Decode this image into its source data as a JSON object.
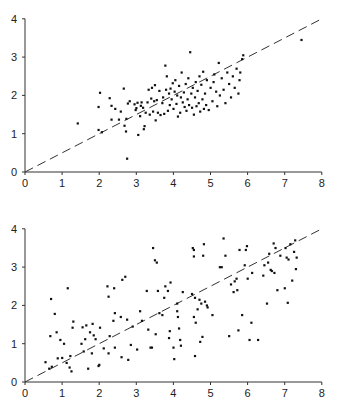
{
  "chart_data": [
    {
      "type": "scatter",
      "title": "",
      "xlabel": "",
      "ylabel": "",
      "xlim": [
        0,
        8
      ],
      "ylim": [
        0,
        4
      ],
      "xticks": [
        0,
        1,
        2,
        3,
        4,
        5,
        6,
        7,
        8
      ],
      "yticks": [
        0,
        1,
        2,
        3,
        4
      ],
      "grid": false,
      "legend": null,
      "reference_line": {
        "style": "dashed",
        "from": [
          0,
          0
        ],
        "to": [
          8,
          4
        ],
        "equation": "y = x/2"
      },
      "points": [
        [
          1.42,
          1.27
        ],
        [
          1.98,
          1.7
        ],
        [
          2.02,
          2.07
        ],
        [
          1.98,
          1.1
        ],
        [
          2.07,
          1.04
        ],
        [
          2.28,
          1.93
        ],
        [
          2.33,
          1.37
        ],
        [
          2.33,
          1.73
        ],
        [
          2.43,
          1.65
        ],
        [
          2.53,
          1.37
        ],
        [
          2.58,
          1.58
        ],
        [
          2.66,
          2.18
        ],
        [
          2.68,
          1.21
        ],
        [
          2.72,
          1.06
        ],
        [
          2.73,
          1.39
        ],
        [
          2.75,
          0.35
        ],
        [
          2.77,
          1.79
        ],
        [
          2.82,
          1.85
        ],
        [
          2.95,
          1.77
        ],
        [
          2.98,
          1.62
        ],
        [
          3.0,
          1.67
        ],
        [
          3.03,
          1.81
        ],
        [
          3.05,
          0.97
        ],
        [
          3.1,
          1.46
        ],
        [
          3.12,
          1.73
        ],
        [
          3.14,
          1.82
        ],
        [
          3.18,
          1.68
        ],
        [
          3.2,
          1.12
        ],
        [
          3.22,
          1.2
        ],
        [
          3.25,
          1.55
        ],
        [
          3.3,
          1.82
        ],
        [
          3.33,
          2.15
        ],
        [
          3.36,
          1.5
        ],
        [
          3.4,
          1.92
        ],
        [
          3.42,
          2.2
        ],
        [
          3.45,
          1.58
        ],
        [
          3.48,
          1.85
        ],
        [
          3.5,
          2.27
        ],
        [
          3.52,
          1.35
        ],
        [
          3.55,
          1.88
        ],
        [
          3.58,
          1.55
        ],
        [
          3.62,
          2.12
        ],
        [
          3.65,
          1.49
        ],
        [
          3.7,
          1.8
        ],
        [
          3.72,
          1.95
        ],
        [
          3.75,
          1.52
        ],
        [
          3.78,
          2.78
        ],
        [
          3.8,
          2.15
        ],
        [
          3.82,
          2.5
        ],
        [
          3.85,
          1.6
        ],
        [
          3.88,
          2.05
        ],
        [
          3.9,
          1.75
        ],
        [
          3.92,
          2.18
        ],
        [
          3.95,
          1.9
        ],
        [
          3.98,
          2.32
        ],
        [
          4.0,
          1.65
        ],
        [
          4.03,
          2.1
        ],
        [
          4.05,
          2.4
        ],
        [
          4.08,
          1.78
        ],
        [
          4.1,
          2.0
        ],
        [
          4.12,
          1.45
        ],
        [
          4.15,
          2.25
        ],
        [
          4.18,
          1.55
        ],
        [
          4.2,
          1.95
        ],
        [
          4.22,
          2.6
        ],
        [
          4.25,
          1.82
        ],
        [
          4.28,
          2.08
        ],
        [
          4.3,
          1.7
        ],
        [
          4.33,
          2.3
        ],
        [
          4.35,
          1.6
        ],
        [
          4.38,
          1.9
        ],
        [
          4.4,
          2.45
        ],
        [
          4.42,
          1.75
        ],
        [
          4.45,
          3.13
        ],
        [
          4.48,
          2.05
        ],
        [
          4.5,
          1.68
        ],
        [
          4.52,
          2.2
        ],
        [
          4.55,
          1.5
        ],
        [
          4.58,
          1.95
        ],
        [
          4.6,
          2.35
        ],
        [
          4.62,
          1.72
        ],
        [
          4.65,
          2.12
        ],
        [
          4.68,
          1.8
        ],
        [
          4.7,
          2.5
        ],
        [
          4.72,
          1.58
        ],
        [
          4.75,
          2.28
        ],
        [
          4.78,
          1.9
        ],
        [
          4.8,
          2.62
        ],
        [
          4.82,
          1.65
        ],
        [
          4.85,
          2.05
        ],
        [
          4.88,
          1.75
        ],
        [
          4.9,
          2.4
        ],
        [
          4.95,
          1.62
        ],
        [
          5.0,
          2.2
        ],
        [
          5.05,
          1.85
        ],
        [
          5.08,
          2.35
        ],
        [
          5.1,
          2.55
        ],
        [
          5.15,
          2.1
        ],
        [
          5.18,
          1.72
        ],
        [
          5.22,
          2.85
        ],
        [
          5.25,
          2.0
        ],
        [
          5.3,
          2.45
        ],
        [
          5.35,
          2.15
        ],
        [
          5.4,
          1.8
        ],
        [
          5.45,
          2.6
        ],
        [
          5.5,
          2.3
        ],
        [
          5.55,
          1.95
        ],
        [
          5.6,
          2.5
        ],
        [
          5.65,
          2.2
        ],
        [
          5.7,
          2.7
        ],
        [
          5.75,
          2.05
        ],
        [
          5.78,
          2.4
        ],
        [
          5.8,
          2.6
        ],
        [
          5.85,
          2.95
        ],
        [
          5.88,
          3.05
        ],
        [
          7.45,
          3.45
        ]
      ]
    },
    {
      "type": "scatter",
      "title": "",
      "xlabel": "",
      "ylabel": "",
      "xlim": [
        0,
        8
      ],
      "ylim": [
        0,
        4
      ],
      "xticks": [
        0,
        1,
        2,
        3,
        4,
        5,
        6,
        7,
        8
      ],
      "yticks": [
        0,
        1,
        2,
        3,
        4
      ],
      "grid": false,
      "legend": null,
      "reference_line": {
        "style": "dashed",
        "from": [
          0,
          0
        ],
        "to": [
          8,
          4
        ],
        "equation": "y = x/2"
      },
      "points": [
        [
          0.55,
          0.52
        ],
        [
          0.65,
          0.35
        ],
        [
          0.68,
          1.2
        ],
        [
          0.7,
          2.17
        ],
        [
          0.72,
          0.4
        ],
        [
          0.8,
          1.78
        ],
        [
          0.85,
          1.3
        ],
        [
          0.88,
          0.62
        ],
        [
          0.95,
          1.1
        ],
        [
          1.0,
          0.63
        ],
        [
          1.05,
          1.0
        ],
        [
          1.12,
          0.5
        ],
        [
          1.15,
          2.45
        ],
        [
          1.2,
          0.38
        ],
        [
          1.22,
          0.68
        ],
        [
          1.25,
          0.28
        ],
        [
          1.28,
          1.42
        ],
        [
          1.3,
          1.58
        ],
        [
          1.52,
          1.0
        ],
        [
          1.55,
          1.43
        ],
        [
          1.58,
          0.8
        ],
        [
          1.62,
          1.12
        ],
        [
          1.65,
          1.48
        ],
        [
          1.7,
          0.35
        ],
        [
          1.75,
          1.3
        ],
        [
          1.8,
          0.75
        ],
        [
          1.82,
          1.52
        ],
        [
          1.85,
          1.22
        ],
        [
          1.9,
          1.12
        ],
        [
          1.98,
          0.42
        ],
        [
          2.0,
          0.45
        ],
        [
          2.02,
          1.42
        ],
        [
          2.12,
          0.88
        ],
        [
          2.22,
          2.5
        ],
        [
          2.25,
          0.75
        ],
        [
          2.25,
          2.23
        ],
        [
          2.28,
          1.2
        ],
        [
          2.38,
          1.6
        ],
        [
          2.4,
          2.45
        ],
        [
          2.42,
          0.9
        ],
        [
          2.42,
          1.8
        ],
        [
          2.58,
          1.7
        ],
        [
          2.6,
          0.65
        ],
        [
          2.62,
          2.67
        ],
        [
          2.7,
          2.75
        ],
        [
          2.75,
          1.63
        ],
        [
          2.78,
          0.58
        ],
        [
          2.85,
          0.97
        ],
        [
          2.9,
          1.45
        ],
        [
          3.02,
          0.85
        ],
        [
          3.1,
          1.85
        ],
        [
          3.15,
          1.6
        ],
        [
          3.28,
          2.38
        ],
        [
          3.32,
          1.37
        ],
        [
          3.38,
          0.9
        ],
        [
          3.42,
          0.9
        ],
        [
          3.45,
          3.5
        ],
        [
          3.5,
          3.18
        ],
        [
          3.52,
          1.25
        ],
        [
          3.55,
          3.12
        ],
        [
          3.58,
          2.38
        ],
        [
          3.62,
          1.8
        ],
        [
          3.7,
          1.75
        ],
        [
          3.75,
          2.2
        ],
        [
          3.78,
          2.5
        ],
        [
          3.85,
          2.38
        ],
        [
          3.88,
          1.15
        ],
        [
          3.9,
          1.33
        ],
        [
          3.92,
          2.6
        ],
        [
          4.0,
          0.9
        ],
        [
          4.02,
          0.6
        ],
        [
          4.1,
          1.85
        ],
        [
          4.1,
          2.05
        ],
        [
          4.12,
          1.7
        ],
        [
          4.15,
          1.4
        ],
        [
          4.18,
          1.1
        ],
        [
          4.2,
          0.95
        ],
        [
          4.25,
          2.35
        ],
        [
          4.5,
          2.3
        ],
        [
          4.52,
          3.5
        ],
        [
          4.55,
          3.45
        ],
        [
          4.55,
          3.28
        ],
        [
          4.55,
          1.7
        ],
        [
          4.58,
          2.2
        ],
        [
          4.58,
          0.68
        ],
        [
          4.6,
          1.55
        ],
        [
          4.65,
          1.9
        ],
        [
          4.7,
          2.15
        ],
        [
          4.72,
          1.05
        ],
        [
          4.75,
          2.05
        ],
        [
          4.78,
          1.18
        ],
        [
          4.8,
          3.3
        ],
        [
          4.82,
          3.6
        ],
        [
          4.85,
          2.1
        ],
        [
          4.9,
          2.0
        ],
        [
          4.92,
          1.95
        ],
        [
          5.05,
          1.75
        ],
        [
          5.25,
          3.0
        ],
        [
          5.3,
          3.0
        ],
        [
          5.35,
          3.75
        ],
        [
          5.4,
          3.3
        ],
        [
          5.5,
          1.2
        ],
        [
          5.55,
          2.55
        ],
        [
          5.62,
          2.35
        ],
        [
          5.65,
          2.63
        ],
        [
          5.7,
          2.7
        ],
        [
          5.72,
          2.4
        ],
        [
          5.75,
          1.35
        ],
        [
          5.78,
          3.45
        ],
        [
          5.85,
          1.75
        ],
        [
          5.92,
          3.05
        ],
        [
          5.95,
          3.45
        ],
        [
          5.98,
          3.55
        ],
        [
          6.0,
          2.7
        ],
        [
          6.05,
          1.1
        ],
        [
          6.1,
          1.55
        ],
        [
          6.12,
          2.85
        ],
        [
          6.28,
          1.1
        ],
        [
          6.42,
          2.78
        ],
        [
          6.45,
          3.05
        ],
        [
          6.52,
          2.05
        ],
        [
          6.55,
          3.12
        ],
        [
          6.58,
          3.35
        ],
        [
          6.62,
          2.93
        ],
        [
          6.65,
          2.9
        ],
        [
          6.7,
          3.62
        ],
        [
          6.72,
          2.85
        ],
        [
          6.75,
          3.5
        ],
        [
          6.8,
          2.4
        ],
        [
          6.88,
          3.3
        ],
        [
          7.0,
          2.45
        ],
        [
          7.02,
          3.5
        ],
        [
          7.05,
          3.25
        ],
        [
          7.08,
          2.07
        ],
        [
          7.1,
          3.2
        ],
        [
          7.15,
          3.6
        ],
        [
          7.2,
          2.65
        ],
        [
          7.25,
          3.4
        ],
        [
          7.28,
          3.7
        ],
        [
          7.3,
          2.95
        ],
        [
          7.32,
          3.25
        ]
      ]
    }
  ],
  "charts": {
    "top": {
      "x_tick_labels": [
        "0",
        "1",
        "2",
        "3",
        "4",
        "5",
        "6",
        "7",
        "8"
      ],
      "y_tick_labels": [
        "0",
        "1",
        "2",
        "3",
        "4"
      ]
    },
    "bottom": {
      "x_tick_labels": [
        "0",
        "1",
        "2",
        "3",
        "4",
        "5",
        "6",
        "7",
        "8"
      ],
      "y_tick_labels": [
        "0",
        "1",
        "2",
        "3",
        "4"
      ]
    }
  },
  "colors": {
    "axis": "#333333",
    "points": "#111111",
    "reference_line": "#333333",
    "background": "#ffffff"
  }
}
